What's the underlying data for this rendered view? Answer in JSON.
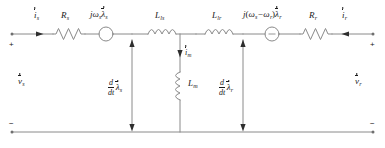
{
  "diagram": {
    "type": "electrical-schematic",
    "line_color": "#808080",
    "text_color": "#1a1a1a",
    "background": "#ffffff"
  },
  "terminals": {
    "left_top_polarity": "+",
    "left_bottom_polarity": "−",
    "right_top_polarity": "+",
    "right_bottom_polarity": "−",
    "left_voltage": {
      "symbol": "v",
      "subscript": "s",
      "vector": true
    },
    "right_voltage": {
      "symbol": "v",
      "subscript": "r",
      "vector": true
    }
  },
  "currents": {
    "stator": {
      "symbol": "i",
      "subscript": "s",
      "vector": true,
      "direction": "right"
    },
    "rotor": {
      "symbol": "i",
      "subscript": "r",
      "vector": true,
      "direction": "left"
    },
    "magnetizing": {
      "symbol": "i",
      "subscript": "m",
      "vector": true,
      "direction": "down"
    }
  },
  "components": {
    "stator_resistance": {
      "symbol": "R",
      "subscript": "s",
      "kind": "resistor"
    },
    "rotor_resistance": {
      "symbol": "R",
      "subscript": "r",
      "kind": "resistor"
    },
    "stator_leakage_inductance": {
      "symbol": "L",
      "subscript": "ls",
      "kind": "inductor"
    },
    "rotor_leakage_inductance": {
      "symbol": "L",
      "subscript": "lr",
      "kind": "inductor"
    },
    "magnetizing_inductance": {
      "symbol": "L",
      "subscript": "m",
      "kind": "inductor"
    },
    "stator_emf_source": {
      "kind": "voltage-source",
      "expr_parts": {
        "j": "j",
        "omega": "ω",
        "omega_sub": "s",
        "lambda": "λ",
        "lambda_sub": "s"
      }
    },
    "rotor_emf_source": {
      "kind": "voltage-source",
      "expr_parts": {
        "j": "j",
        "open": "(",
        "omega1": "ω",
        "omega1_sub": "s",
        "minus": "−",
        "omega2": "ω",
        "omega2_sub": "r",
        "close": ")",
        "lambda": "λ",
        "lambda_sub": "r"
      }
    }
  },
  "branch_voltages": {
    "stator_flux_derivative": {
      "numerator": "d",
      "denominator": "dt",
      "symbol": "λ",
      "subscript": "s",
      "vector": true
    },
    "rotor_flux_derivative": {
      "numerator": "d",
      "denominator": "dt",
      "symbol": "λ",
      "subscript": "r",
      "vector": true
    }
  }
}
